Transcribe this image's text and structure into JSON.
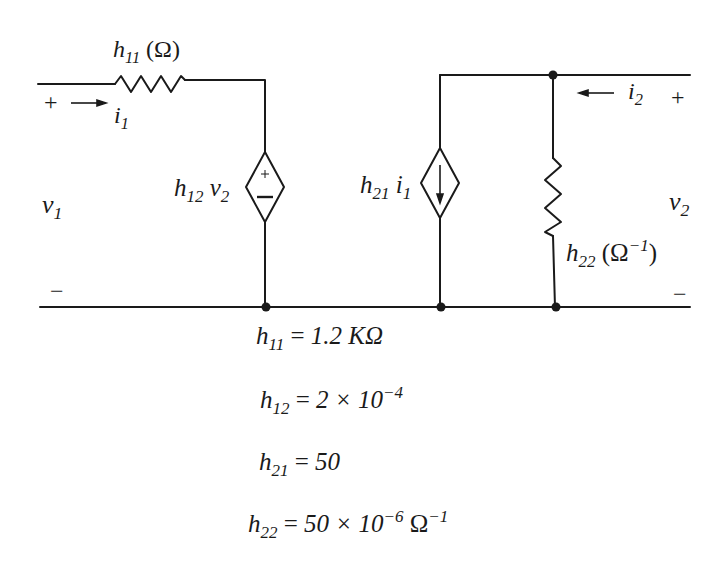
{
  "diagram": {
    "labels": {
      "h11_resistor": {
        "base": "h",
        "sub": "11",
        "unit": "(Ω)"
      },
      "i1": {
        "base": "i",
        "sub": "1"
      },
      "v1": {
        "base": "v",
        "sub": "1"
      },
      "h12v2": {
        "base": "h",
        "sub": "12",
        "var": "v",
        "var_sub": "2"
      },
      "h21i1": {
        "base": "h",
        "sub": "21",
        "var": "i",
        "var_sub": "1"
      },
      "i2": {
        "base": "i",
        "sub": "2"
      },
      "v2": {
        "base": "v",
        "sub": "2"
      },
      "h22_resistor": {
        "base": "h",
        "sub": "22",
        "unit_open": "(Ω",
        "unit_sup": "−1",
        "unit_close": ")"
      },
      "plus": "+",
      "minus": "−",
      "src_plus": "+",
      "src_minus": "−"
    },
    "equations": [
      {
        "base": "h",
        "sub": "11",
        "eq": "=",
        "value": "1.2 KΩ"
      },
      {
        "base": "h",
        "sub": "12",
        "eq": "=",
        "value": "2 × 10",
        "exp": "−4"
      },
      {
        "base": "h",
        "sub": "21",
        "eq": "=",
        "value": "50"
      },
      {
        "base": "h",
        "sub": "22",
        "eq": "=",
        "value": "50 × 10",
        "exp": "−6",
        "tail": "Ω",
        "tail_exp": "−1"
      }
    ],
    "colors": {
      "line": "#1a1a1a",
      "background": "#ffffff"
    }
  }
}
